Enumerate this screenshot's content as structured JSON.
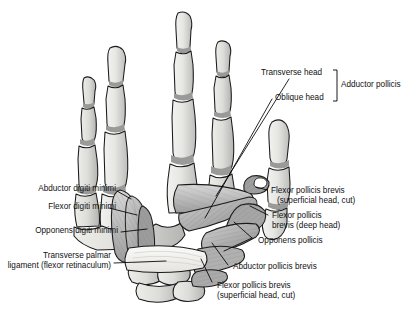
{
  "figure": {
    "kind": "anatomical-illustration",
    "palette": {
      "background": "#ffffff",
      "outline": "#1a1a1a",
      "bone_light": "#e9e9e7",
      "bone_shadow": "#c3c3c1",
      "cartilage_gray": "#9a9a98",
      "muscle_light": "#d2d2d2",
      "muscle_mid": "#aeaeae",
      "muscle_dark": "#8a8a8a",
      "ligament": "#f2f1ee",
      "leader_line": "#000000"
    }
  },
  "labels": {
    "transverse_head": "Transverse head",
    "oblique_head": "Oblique head",
    "adductor_pollicis": "Adductor pollicis",
    "abductor_digiti_minimi": "Abductor digiti minimi",
    "flexor_digiti_minimi": "Flexor digiti minimi",
    "opponens_digiti_minimi": "Opponens digiti minimi",
    "transverse_palmar_ligament_line1": "Transverse palmar",
    "transverse_palmar_ligament_line2": "ligament (flexor retinaculum)",
    "flexor_pollicis_brevis_superficial_right_line1": "Flexor pollicis brevis",
    "flexor_pollicis_brevis_superficial_right_line2": "(superficial head, cut)",
    "flexor_pollicis_brevis_deep_line1": "Flexor pollicis",
    "flexor_pollicis_brevis_deep_line2": "brevis (deep head)",
    "opponens_pollicis": "Opponens pollicis",
    "abductor_pollicis_brevis": "Abductor pollicis brevis",
    "flexor_pollicis_brevis_superficial_bottom_line1": "Flexor pollicis brevis",
    "flexor_pollicis_brevis_superficial_bottom_line2": "(superficial head, cut)"
  }
}
